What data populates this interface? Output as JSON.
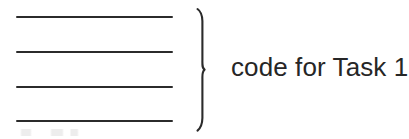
{
  "figure": {
    "type": "hand-drawn-diagram",
    "background_color": "#ffffff",
    "ink_color": "#2b2b2b",
    "text_color": "#262626",
    "code_block": {
      "name": "code-line-group",
      "line_count": 4,
      "lines": [
        {
          "id": "code-line-1",
          "label": ""
        },
        {
          "id": "code-line-2",
          "label": ""
        },
        {
          "id": "code-line-3",
          "label": ""
        },
        {
          "id": "code-line-4",
          "label": ""
        }
      ]
    },
    "brace": {
      "name": "right-curly-brace",
      "glyph": "}",
      "orientation": "right"
    },
    "annotation": {
      "text": "code for Task 1"
    }
  }
}
